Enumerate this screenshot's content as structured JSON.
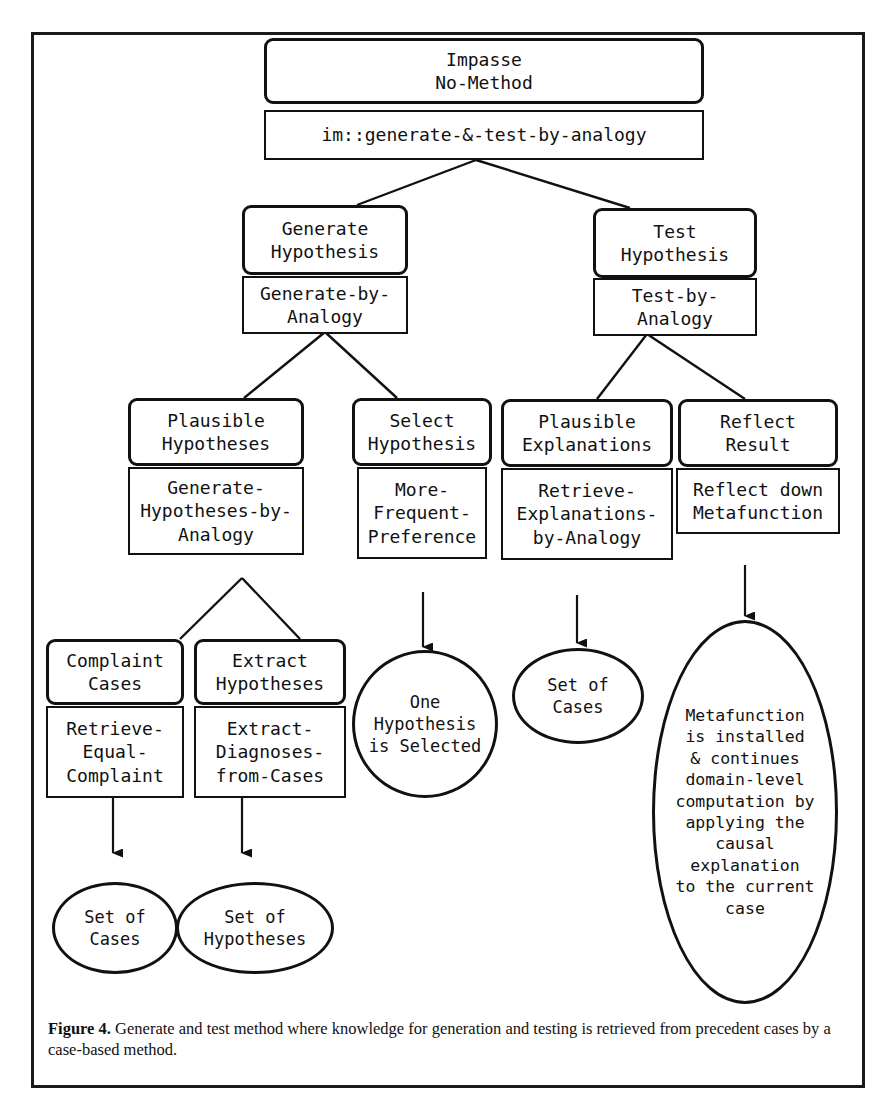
{
  "figure": {
    "caption_label": "Figure 4.",
    "caption_text": " Generate and test method where knowledge for generation and testing is retrieved from precedent cases by a case-based method."
  },
  "diagram": {
    "type": "task-method-knowledge tree",
    "root": {
      "goal": "Impasse\nNo-Method",
      "method": "im::generate-&-test-by-analogy"
    },
    "nodes": [
      {
        "id": "impasse",
        "shape": "rounded-box",
        "kind": "goal",
        "label": "Impasse\nNo-Method"
      },
      {
        "id": "im-gen-test",
        "shape": "box",
        "kind": "method",
        "label": "im::generate-&-test-by-analogy"
      },
      {
        "id": "generate-hypothesis",
        "shape": "rounded-box",
        "kind": "goal",
        "label": "Generate\nHypothesis"
      },
      {
        "id": "generate-by-analogy",
        "shape": "box",
        "kind": "method",
        "label": "Generate-by-\nAnalogy"
      },
      {
        "id": "test-hypothesis",
        "shape": "rounded-box",
        "kind": "goal",
        "label": "Test\nHypothesis"
      },
      {
        "id": "test-by-analogy",
        "shape": "box",
        "kind": "method",
        "label": "Test-by-\nAnalogy"
      },
      {
        "id": "plausible-hypotheses",
        "shape": "rounded-box",
        "kind": "goal",
        "label": "Plausible\nHypotheses"
      },
      {
        "id": "generate-hypotheses-by-analogy",
        "shape": "box",
        "kind": "method",
        "label": "Generate-\nHypotheses-by-\nAnalogy"
      },
      {
        "id": "select-hypothesis",
        "shape": "rounded-box",
        "kind": "goal",
        "label": "Select\nHypothesis"
      },
      {
        "id": "more-frequent-preference",
        "shape": "box",
        "kind": "method",
        "label": "More-\nFrequent-\nPreference"
      },
      {
        "id": "plausible-explanations",
        "shape": "rounded-box",
        "kind": "goal",
        "label": "Plausible\nExplanations"
      },
      {
        "id": "retrieve-explanations-by-analogy",
        "shape": "box",
        "kind": "method",
        "label": "Retrieve-\nExplanations-\nby-Analogy"
      },
      {
        "id": "reflect-result",
        "shape": "rounded-box",
        "kind": "goal",
        "label": "Reflect\nResult"
      },
      {
        "id": "reflect-down-metafunction",
        "shape": "box",
        "kind": "method",
        "label": "Reflect down\nMetafunction"
      },
      {
        "id": "complaint-cases",
        "shape": "rounded-box",
        "kind": "goal",
        "label": "Complaint\nCases"
      },
      {
        "id": "retrieve-equal-complaint",
        "shape": "box",
        "kind": "method",
        "label": "Retrieve-\nEqual-\nComplaint"
      },
      {
        "id": "extract-hypotheses",
        "shape": "rounded-box",
        "kind": "goal",
        "label": "Extract\nHypotheses"
      },
      {
        "id": "extract-diagnoses-from-cases",
        "shape": "box",
        "kind": "method",
        "label": "Extract-\nDiagnoses-\nfrom-Cases"
      },
      {
        "id": "set-of-cases-left",
        "shape": "ellipse",
        "kind": "result",
        "label": "Set of\nCases"
      },
      {
        "id": "set-of-hypotheses",
        "shape": "ellipse",
        "kind": "result",
        "label": "Set of\nHypotheses"
      },
      {
        "id": "one-hypothesis-is-selected",
        "shape": "circle",
        "kind": "result",
        "label": "One\nHypothesis\nis Selected"
      },
      {
        "id": "set-of-cases-right",
        "shape": "ellipse",
        "kind": "result",
        "label": "Set of\nCases"
      },
      {
        "id": "metafunction-result",
        "shape": "ellipse",
        "kind": "result",
        "label": "Metafunction\nis installed\n& continues\ndomain-level\ncomputation by\napplying the\ncausal\nexplanation\nto the current\ncase"
      }
    ],
    "edges": [
      {
        "from": "im-gen-test",
        "to": "generate-hypothesis",
        "style": "line"
      },
      {
        "from": "im-gen-test",
        "to": "test-hypothesis",
        "style": "line"
      },
      {
        "from": "generate-by-analogy",
        "to": "plausible-hypotheses",
        "style": "line"
      },
      {
        "from": "generate-by-analogy",
        "to": "select-hypothesis",
        "style": "line"
      },
      {
        "from": "test-by-analogy",
        "to": "plausible-explanations",
        "style": "line"
      },
      {
        "from": "test-by-analogy",
        "to": "reflect-result",
        "style": "line"
      },
      {
        "from": "generate-hypotheses-by-analogy",
        "to": "complaint-cases",
        "style": "line"
      },
      {
        "from": "generate-hypotheses-by-analogy",
        "to": "extract-hypotheses",
        "style": "line"
      },
      {
        "from": "retrieve-equal-complaint",
        "to": "set-of-cases-left",
        "style": "arrow"
      },
      {
        "from": "extract-diagnoses-from-cases",
        "to": "set-of-hypotheses",
        "style": "arrow"
      },
      {
        "from": "more-frequent-preference",
        "to": "one-hypothesis-is-selected",
        "style": "arrow"
      },
      {
        "from": "retrieve-explanations-by-analogy",
        "to": "set-of-cases-right",
        "style": "arrow"
      },
      {
        "from": "reflect-down-metafunction",
        "to": "metafunction-result",
        "style": "arrow"
      }
    ]
  }
}
